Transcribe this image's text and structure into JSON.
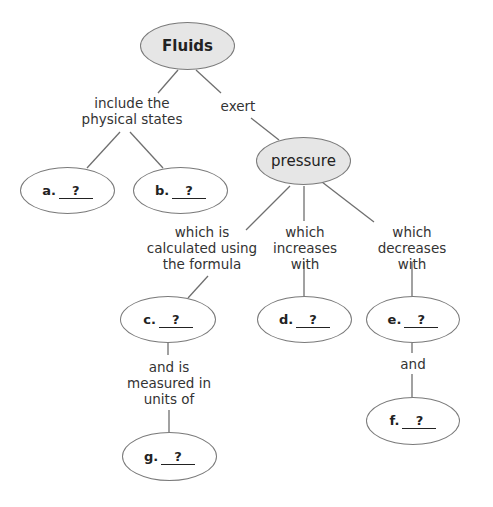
{
  "nodes": {
    "fluids": "Fluids",
    "pressure": "pressure",
    "a": {
      "letter": "a.",
      "blank": "?"
    },
    "b": {
      "letter": "b.",
      "blank": "?"
    },
    "c": {
      "letter": "c.",
      "blank": "?"
    },
    "d": {
      "letter": "d.",
      "blank": "?"
    },
    "e": {
      "letter": "e.",
      "blank": "?"
    },
    "f": {
      "letter": "f.",
      "blank": "?"
    },
    "g": {
      "letter": "g.",
      "blank": "?"
    }
  },
  "links": {
    "include": [
      "include the",
      "physical states"
    ],
    "exert": [
      "exert"
    ],
    "calculated": [
      "which is",
      "calculated using",
      "the formula"
    ],
    "increases": [
      "which",
      "increases",
      "with"
    ],
    "decreases": [
      "which",
      "decreases",
      "with"
    ],
    "measured": [
      "and is",
      "measured in",
      "units of"
    ],
    "and": [
      "and"
    ]
  },
  "colors": {
    "main_fill": "#e6e6e6",
    "outline": "#7a7a7a",
    "line": "#6f6f6f"
  }
}
